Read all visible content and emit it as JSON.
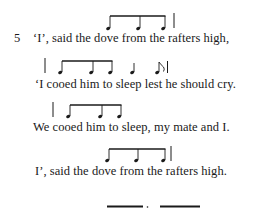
{
  "poem": {
    "stanza_number": "5",
    "lines": [
      {
        "text": "‘I’, said the dove from the rafters high,"
      },
      {
        "text": "‘I cooed him to sleep lest he should cry."
      },
      {
        "text": "We cooed him to sleep, my mate and I."
      },
      {
        "text": "I’, said the dove from the rafters high."
      }
    ]
  },
  "rhythm_notation": {
    "line_1": [
      "beamed-eighth",
      "beamed-eighth",
      "beamed-eighth",
      "bar"
    ],
    "line_2": [
      "bar",
      "beamed-eighth",
      "beamed-eighth",
      "beamed-eighth",
      "quarter",
      "eighth-flag",
      "bar"
    ],
    "line_3": [
      "bar",
      "beamed-eighth",
      "beamed-eighth",
      "beamed-eighth"
    ],
    "line_4": [
      "beamed-eighth",
      "beamed-eighth",
      "beamed-eighth",
      "bar"
    ],
    "line_5_partial": [
      "beam",
      "dot",
      "beam"
    ]
  },
  "colors": {
    "ink": "#1a1a1a",
    "background": "#ffffff"
  }
}
